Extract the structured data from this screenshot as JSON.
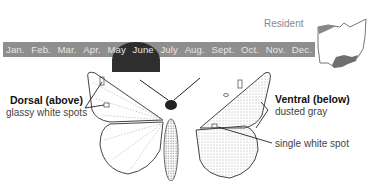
{
  "range": {
    "status_label": "Resident",
    "map_icon": "ohio-state-map"
  },
  "flight_calendar": {
    "months": [
      "Jan.",
      "Feb.",
      "Mar.",
      "Apr.",
      "May",
      "June",
      "July",
      "Aug.",
      "Sept.",
      "Oct.",
      "Nov.",
      "Dec."
    ],
    "active_months": [
      "May",
      "June"
    ],
    "bar_color": "#8e8e8e",
    "active_color": "#2e2e2e"
  },
  "dorsal": {
    "title": "Dorsal (above)",
    "note": "glassy white spots"
  },
  "ventral": {
    "title": "Ventral (below)",
    "note": "dusted gray",
    "spot_note": "single white spot"
  }
}
